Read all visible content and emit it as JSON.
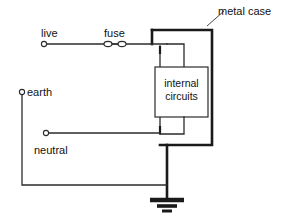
{
  "diagram": {
    "type": "circuit-schematic",
    "background_color": "#ffffff",
    "line_color": "#2b2b2b",
    "thick_line_color": "#1a1a1a",
    "labels": {
      "live": "live",
      "fuse": "fuse",
      "neutral": "neutral",
      "earth": "earth",
      "metal_case": "metal case",
      "internal_circuits_line1": "internal",
      "internal_circuits_line2": "circuits"
    },
    "components": [
      {
        "name": "live-terminal",
        "kind": "terminal-circle",
        "x": 44,
        "y": 44
      },
      {
        "name": "fuse",
        "kind": "fuse-symbol",
        "x": 115,
        "y": 44
      },
      {
        "name": "neutral-terminal",
        "kind": "terminal-circle",
        "x": 46,
        "y": 133
      },
      {
        "name": "earth-terminal",
        "kind": "terminal-circle",
        "x": 22,
        "y": 92
      },
      {
        "name": "metal-case",
        "kind": "thick-rectangle-open",
        "x": 152,
        "y": 30,
        "width": 60,
        "height": 115
      },
      {
        "name": "internal-circuits",
        "kind": "rectangle",
        "x": 155,
        "y": 67,
        "width": 53,
        "height": 50
      },
      {
        "name": "earth-ground-symbol",
        "kind": "ground",
        "x": 167,
        "y": 199
      }
    ],
    "wires": [
      {
        "name": "live-wire",
        "from": "live-terminal",
        "to": "internal-circuits"
      },
      {
        "name": "neutral-wire",
        "from": "neutral-terminal",
        "to": "internal-circuits"
      },
      {
        "name": "earth-wire",
        "from": "earth-terminal",
        "to": "earth-ground-symbol"
      },
      {
        "name": "case-earth-bond",
        "from": "metal-case",
        "to": "earth-ground-symbol"
      }
    ]
  }
}
